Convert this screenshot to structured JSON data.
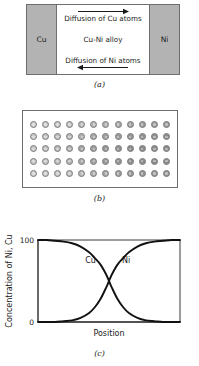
{
  "figure": {
    "panel_a": {
      "caption": "(a)",
      "left_metal_label": "Cu",
      "right_metal_label": "Ni",
      "alloy_label": "Cu-Ni alloy",
      "top_diffusion_label": "Diffusion of Cu atoms",
      "top_arrow_direction": "right",
      "bottom_diffusion_label": "Diffusion of Ni atoms",
      "bottom_arrow_direction": "left",
      "metal_block_color": "#b3b3b3",
      "alloy_color": "#ffffff",
      "border_color": "#6e6e6e"
    },
    "panel_b": {
      "caption": "(b)",
      "description": "atomic lattice of intermixed Cu and Ni atoms",
      "rows": 5,
      "columns": 12,
      "atom_count": 60,
      "atom_shades": [
        [
          "#c9c9c9",
          "#c6c6c6",
          "#c3c3c3",
          "#bfbfbf",
          "#bababa",
          "#b4b4b4",
          "#aeaeae",
          "#a8a8a8",
          "#a2a2a2",
          "#9c9c9c",
          "#979797",
          "#939393"
        ],
        [
          "#c7c7c7",
          "#c3c3c3",
          "#bebebe",
          "#b9b9b9",
          "#b2b2b2",
          "#a9a9a9",
          "#a2a2a2",
          "#9b9b9b",
          "#969696",
          "#929292",
          "#8f8f8f",
          "#8d8d8d"
        ],
        [
          "#c5c5c5",
          "#c0c0c0",
          "#bababa",
          "#b2b2b2",
          "#a8a8a8",
          "#9e9e9e",
          "#969696",
          "#919191",
          "#8e8e8e",
          "#8c8c8c",
          "#8b8b8b",
          "#8a8a8a"
        ],
        [
          "#c7c7c7",
          "#c3c3c3",
          "#bdbdbd",
          "#b6b6b6",
          "#adadad",
          "#a3a3a3",
          "#9a9a9a",
          "#949494",
          "#909090",
          "#8e8e8e",
          "#8c8c8c",
          "#8b8b8b"
        ],
        [
          "#c9c9c9",
          "#c6c6c6",
          "#c2c2c2",
          "#bcbcbc",
          "#b5b5b5",
          "#adadad",
          "#a5a5a5",
          "#9e9e9e",
          "#999999",
          "#959595",
          "#929292",
          "#909090"
        ]
      ],
      "atom_outline_color": "#7d7d7d"
    },
    "panel_c": {
      "caption": "(c)"
    }
  },
  "chart_data": {
    "type": "line",
    "title": "",
    "xlabel": "Position",
    "ylabel": "Concentration of Ni, Cu",
    "ytick_labels": [
      "100",
      "0"
    ],
    "ylim": [
      0,
      100
    ],
    "xlim": [
      0,
      100
    ],
    "grid": false,
    "legend": "inline-annotations",
    "annotations": [
      {
        "text": "Cu",
        "x": 37,
        "y": 72
      },
      {
        "text": "Ni",
        "x": 62,
        "y": 72
      }
    ],
    "series": [
      {
        "name": "Cu",
        "description": "copper concentration, high at left, sigmoid decrease to zero at right",
        "x": [
          0,
          6,
          12,
          18,
          24,
          30,
          36,
          40,
          44,
          48,
          50,
          52,
          56,
          60,
          64,
          70,
          76,
          82,
          88,
          94,
          100
        ],
        "values": [
          100,
          100,
          99,
          98,
          96,
          92,
          85,
          78,
          70,
          58,
          50,
          42,
          28,
          18,
          11,
          5,
          2,
          1,
          0,
          0,
          0
        ]
      },
      {
        "name": "Ni",
        "description": "nickel concentration, zero at left, sigmoid increase to full at right",
        "x": [
          0,
          6,
          12,
          18,
          24,
          30,
          36,
          40,
          44,
          48,
          50,
          52,
          56,
          60,
          64,
          70,
          76,
          82,
          88,
          94,
          100
        ],
        "values": [
          0,
          0,
          0,
          1,
          2,
          5,
          11,
          18,
          28,
          42,
          50,
          58,
          70,
          78,
          85,
          92,
          96,
          98,
          99,
          100,
          100
        ]
      }
    ]
  }
}
